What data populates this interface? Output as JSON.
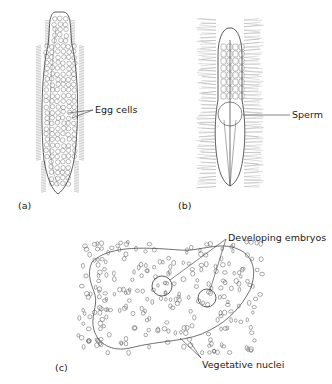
{
  "figure": {
    "panels": [
      {
        "id": "a",
        "label": "(a)",
        "annotations": [
          "Egg cells"
        ]
      },
      {
        "id": "b",
        "label": "(b)",
        "annotations": [
          "Sperm"
        ]
      },
      {
        "id": "c",
        "label": "(c)",
        "annotations": [
          "Developing embryos",
          "Vegetative nuclei"
        ]
      }
    ]
  },
  "colors": {
    "line": "#333333",
    "background": "#ffffff"
  }
}
